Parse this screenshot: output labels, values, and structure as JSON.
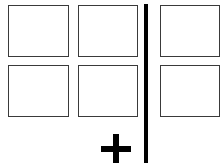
{
  "diagram": {
    "boxes": [
      {
        "id": "r1c1",
        "row": 1,
        "col": 1
      },
      {
        "id": "r1c2",
        "row": 1,
        "col": 2
      },
      {
        "id": "r1c3",
        "row": 1,
        "col": 3
      },
      {
        "id": "r2c1",
        "row": 2,
        "col": 1
      },
      {
        "id": "r2c2",
        "row": 2,
        "col": 2
      },
      {
        "id": "r2c3",
        "row": 2,
        "col": 3
      }
    ],
    "divider": {
      "orientation": "vertical",
      "color": "#000000"
    },
    "add_symbol": {
      "icon": "plus-icon",
      "color": "#000000"
    },
    "colors": {
      "box_border": "#3a3a3a",
      "background": "#ffffff"
    }
  }
}
